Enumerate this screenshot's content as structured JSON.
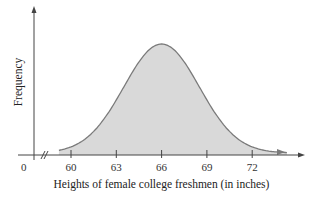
{
  "chart_data": {
    "type": "area",
    "title": "",
    "xlabel": "Heights of female college freshmen (in inches)",
    "ylabel": "Frequency",
    "origin_label": "0",
    "x_axis_break": true,
    "tick_labels": [
      "60",
      "63",
      "66",
      "69",
      "72"
    ],
    "x_ticks": [
      60,
      63,
      66,
      69,
      72
    ],
    "distribution": "normal",
    "mean": 66,
    "std_dev": 2.5,
    "grid": false,
    "legend": null,
    "fill_color": "#d9d9d9",
    "line_color": "#7a7a7a"
  }
}
